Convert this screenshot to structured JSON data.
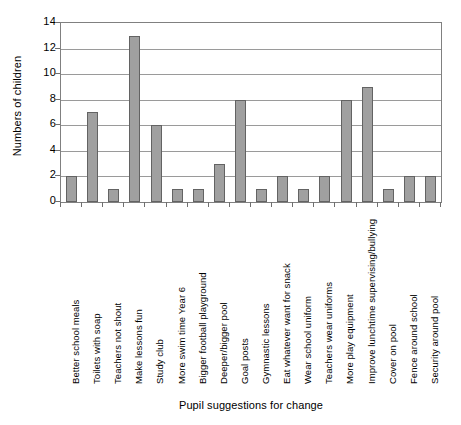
{
  "chart_data": {
    "type": "bar",
    "title": "",
    "xlabel": "Pupil suggestions for change",
    "ylabel": "Numbers of children",
    "ylim": [
      0,
      14
    ],
    "ytick_step": 2,
    "yticks": [
      0,
      2,
      4,
      6,
      8,
      10,
      12,
      14
    ],
    "ytick_labels": [
      "0",
      "2",
      "4",
      "6",
      "8",
      "10",
      "12",
      "14"
    ],
    "grid": "horizontal",
    "legend": "none",
    "bar_color": "#a0a0a0",
    "bar_border_color": "#636363",
    "gridline_color": "#9a9a9a",
    "axis_color": "#808080",
    "background": "#ffffff",
    "categories": [
      "Better school meals",
      "Toilets with soap",
      "Teachers not shout",
      "Make lessons fun",
      "Study club",
      "More swim time Year 6",
      "Bigger football playground",
      "Deeper/bigger pool",
      "Goal posts",
      "Gymnastic lessons",
      "Eat whatever want for snack",
      "Wear school uniform",
      "Teachers wear uniforms",
      "More play equipment",
      "Improve lunchtime supervising/bullying",
      "Cover on pool",
      "Fence around school",
      "Security around pool"
    ],
    "values": [
      2,
      7,
      1,
      13,
      6,
      1,
      1,
      3,
      8,
      1,
      2,
      1,
      2,
      8,
      9,
      1,
      2,
      2
    ]
  }
}
